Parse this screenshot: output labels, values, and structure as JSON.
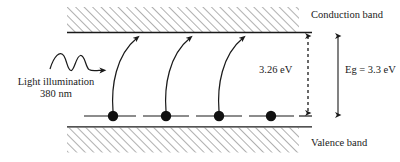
{
  "figure": {
    "labels": {
      "conduction_band": "Conduction band",
      "valence_band": "Valence band",
      "transition_energy": "3.26 eV",
      "band_gap": "Eg = 3.3 eV",
      "light_source_line1": "Light illumination",
      "light_source_line2": "380 nm"
    },
    "colors": {
      "stroke": "#1a1a1a",
      "hatch": "#6e6e6e",
      "electron": "#111111",
      "background": "#ffffff"
    },
    "bands": {
      "conduction": {
        "hatch_x": 67,
        "hatch_y": 7,
        "hatch_width": 232,
        "hatch_height": 25,
        "edge_line_y": 32.5,
        "edge_line_x1": 67,
        "edge_line_x2": 312
      },
      "valence": {
        "hatch_x": 67,
        "hatch_y": 127,
        "hatch_width": 232,
        "hatch_height": 25,
        "edge_line_y": 126.5,
        "edge_line_x1": 67,
        "edge_line_x2": 312
      }
    },
    "electron_level_line": {
      "y": 116,
      "x1": 84,
      "x2": 312
    },
    "electrons": [
      {
        "name": "electron-1",
        "cx": 113,
        "cy": 116,
        "r": 5.2
      },
      {
        "name": "electron-2",
        "cx": 166,
        "cy": 116,
        "r": 5.2
      },
      {
        "name": "electron-3",
        "cx": 219,
        "cy": 116,
        "r": 5.2
      },
      {
        "name": "electron-4",
        "cx": 271,
        "cy": 116,
        "r": 5.2
      }
    ],
    "excitation_arrows": [
      {
        "name": "excitation-arrow-1",
        "path": "M 113 113 C 112 84 118 54 139 37",
        "head_x": 141,
        "head_y": 35,
        "head_angle": -41
      },
      {
        "name": "excitation-arrow-2",
        "path": "M 166 113 C 165 84 171 54 191 37",
        "head_x": 193,
        "head_y": 35,
        "head_angle": -41
      },
      {
        "name": "excitation-arrow-3",
        "path": "M 219 113 C 218 84 224 54 244 37",
        "head_x": 246,
        "head_y": 35,
        "head_angle": -41
      }
    ],
    "measure_arrows": [
      {
        "name": "transition-energy-arrow",
        "x": 308,
        "y_top": 34,
        "y_bottom": 115,
        "style": "dashed"
      },
      {
        "name": "band-gap-arrow",
        "x": 338,
        "y_top": 34,
        "y_bottom": 117,
        "style": "solid"
      }
    ],
    "photon_wave": {
      "name": "photon-wave-arrow",
      "path": "M 50 68 C 55 57 60 52 64 57 C 67 61 68 70 71 70 C 74 70 76 57 80 56 C 84 55 85 67 88 69 C 90 70 93 70 97 70 L 104 70",
      "arrow_tip_x": 110,
      "arrow_tip_y": 70
    }
  }
}
